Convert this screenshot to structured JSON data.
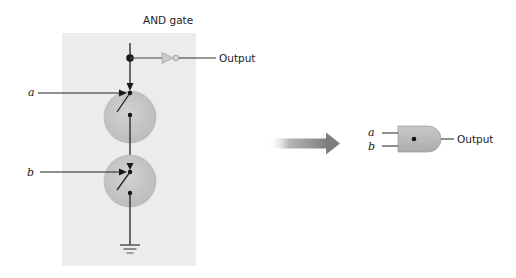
{
  "diagram": {
    "title": "AND gate",
    "transistor_circuit": {
      "inputs": [
        {
          "label": "a"
        },
        {
          "label": "b"
        }
      ],
      "output_label": "Output",
      "components": [
        "power-wire",
        "junction",
        "inverter",
        "switch-a",
        "switch-b",
        "ground"
      ]
    },
    "transform_arrow": "right-arrow",
    "gate_symbol": {
      "type": "AND",
      "inputs": [
        {
          "label": "a"
        },
        {
          "label": "b"
        }
      ],
      "output_label": "Output"
    },
    "colors": {
      "panel": "#ececec",
      "switch_circle": "#c9c9c9",
      "gate_body": "#bdbdbd",
      "inverter": "#c8c8c8",
      "wire": "#222222",
      "arrow": "#8a8a8a"
    }
  }
}
